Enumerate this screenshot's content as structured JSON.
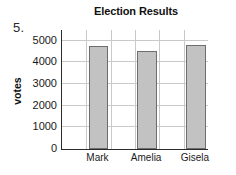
{
  "problem": {
    "number": "5."
  },
  "chart_data": {
    "type": "bar",
    "title": "Election Results",
    "xlabel": "",
    "ylabel": "votes",
    "categories": [
      "Mark",
      "Amelia",
      "Gisela"
    ],
    "values": [
      4750,
      4550,
      4800
    ],
    "ylim": [
      0,
      5500
    ],
    "yticks": [
      0,
      1000,
      2000,
      3000,
      4000,
      5000
    ],
    "ytick_labels": [
      "0",
      "1000",
      "2000",
      "3000",
      "4000",
      "5000"
    ],
    "grid": "both",
    "legend": "none",
    "bar_color": "#c2c2c2",
    "bar_edge_color": "#6e6e6e",
    "axis_color": "#2b2b2b",
    "grid_color": "#c9c9c9",
    "annotations": []
  }
}
